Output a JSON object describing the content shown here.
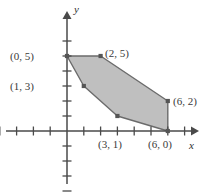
{
  "figure": {
    "kind": "cartesian-plot",
    "background": "#ffffff",
    "axis_color": "#4a4a4a",
    "region_fill": "#bfbfbf",
    "region_stroke": "#6b6b6b",
    "vertex_color": "#555555",
    "label_color": "#3a3a3a"
  },
  "axes": {
    "x_label": "x",
    "y_label": "y",
    "origin_px": {
      "x": 67,
      "y": 131
    },
    "unit_px": {
      "x": 16.8,
      "y": 15
    },
    "x_range": [
      -4,
      8
    ],
    "y_range": [
      -4,
      7
    ],
    "x_ticks": [
      -4,
      -3,
      -2,
      -1,
      1,
      2,
      3,
      4,
      5,
      6,
      7
    ],
    "y_ticks": [
      -4,
      -3,
      -2,
      -1,
      1,
      2,
      3,
      4,
      5,
      6
    ],
    "grid": false,
    "tick_labels_shown": false
  },
  "chart_data": {
    "type": "scatter",
    "title": "",
    "xlabel": "x",
    "ylabel": "y",
    "xlim": [
      -4,
      8
    ],
    "ylim": [
      -4,
      7
    ],
    "grid": false,
    "series": [
      {
        "name": "feasible region vertices",
        "kind": "polygon",
        "closed": true,
        "fill": "#bfbfbf",
        "stroke": "#6b6b6b",
        "points": [
          {
            "x": 0,
            "y": 5,
            "label": "(0, 5)"
          },
          {
            "x": 2,
            "y": 5,
            "label": "(2, 5)"
          },
          {
            "x": 6,
            "y": 2,
            "label": "(6, 2)"
          },
          {
            "x": 6,
            "y": 0,
            "label": "(6, 0)"
          },
          {
            "x": 3,
            "y": 1,
            "label": "(3, 1)"
          },
          {
            "x": 1,
            "y": 3,
            "label": "(1, 3)"
          }
        ]
      }
    ]
  },
  "labels": {
    "p0_5": "(0, 5)",
    "p1_3": "(1, 3)",
    "p2_5": "(2, 5)",
    "p6_2": "(6, 2)",
    "p3_1": "(3, 1)",
    "p6_0": "(6, 0)"
  }
}
